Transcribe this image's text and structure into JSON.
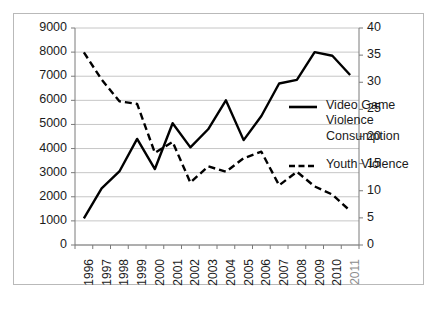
{
  "chart_data": {
    "type": "line",
    "title": "",
    "xlabel": "",
    "categories": [
      "1996",
      "1997",
      "1998",
      "1999",
      "2000",
      "2001",
      "2002",
      "2003",
      "2004",
      "2005",
      "2006",
      "2007",
      "2008",
      "2009",
      "2010",
      "2011"
    ],
    "grid": true,
    "legend_position": "right",
    "axes": {
      "left": {
        "label": "",
        "ylim": [
          0,
          9000
        ],
        "ticks": [
          "0",
          "1000",
          "2000",
          "3000",
          "4000",
          "5000",
          "6000",
          "7000",
          "8000",
          "9000"
        ],
        "tick_values": [
          0,
          1000,
          2000,
          3000,
          4000,
          5000,
          6000,
          7000,
          8000,
          9000
        ]
      },
      "right": {
        "label": "",
        "ylim": [
          0,
          40
        ],
        "ticks": [
          "0",
          "5",
          "10",
          "15",
          "20",
          "25",
          "30",
          "35",
          "40"
        ],
        "tick_values": [
          0,
          5,
          10,
          15,
          20,
          25,
          30,
          35,
          40
        ]
      }
    },
    "series": [
      {
        "name": "Video Game Violence Consumption",
        "axis": "left",
        "style": "solid",
        "color": "#000000",
        "values": [
          1100,
          2350,
          3050,
          4400,
          3150,
          5050,
          4050,
          4800,
          6000,
          4350,
          5350,
          6700,
          6850,
          8000,
          7850,
          7050
        ]
      },
      {
        "name": "Youth Violence",
        "axis": "right",
        "style": "dashed",
        "color": "#000000",
        "values": [
          35.5,
          30.5,
          26.5,
          26.0,
          17.0,
          19.0,
          11.5,
          14.5,
          13.5,
          16.0,
          17.2,
          11.0,
          13.5,
          10.8,
          9.3,
          6.3
        ]
      }
    ]
  },
  "legend": {
    "entries": [
      {
        "label": "Video Game Violence Consumption",
        "style": "solid"
      },
      {
        "label": "Youth Violence",
        "style": "dashed"
      }
    ]
  },
  "caption": {
    "text": ""
  }
}
